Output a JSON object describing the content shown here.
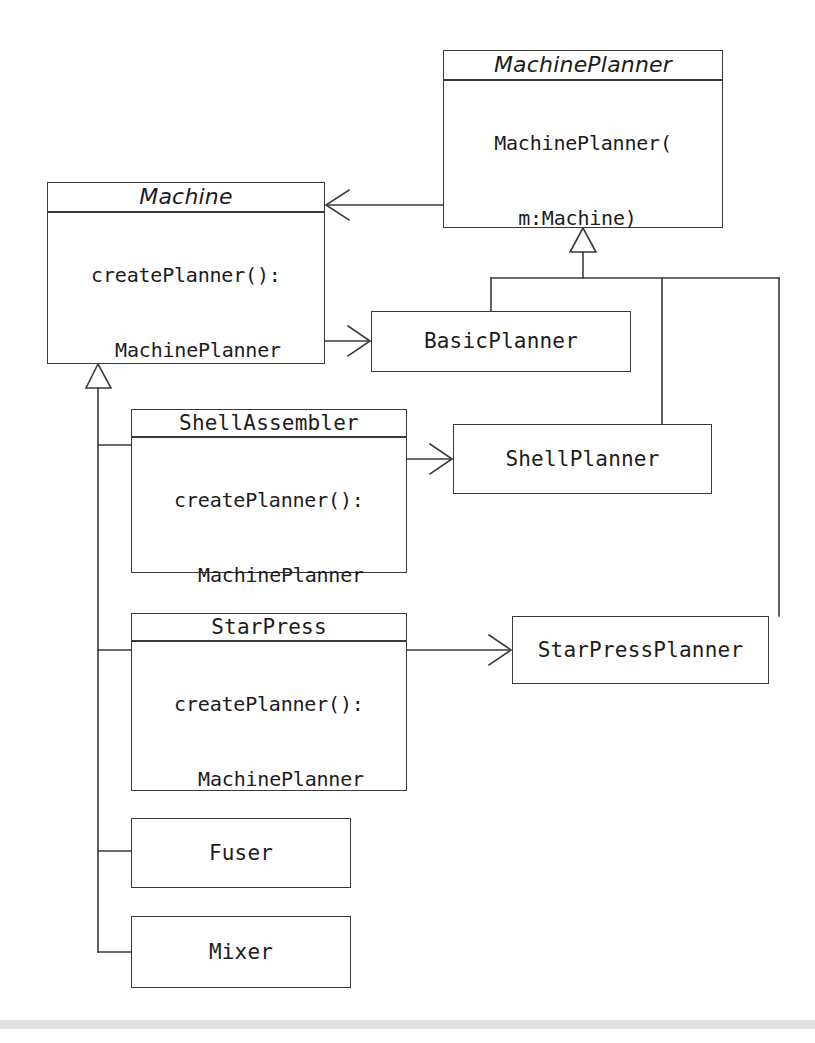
{
  "diagram": {
    "type": "uml-class-diagram",
    "canvas": {
      "width": 815,
      "height": 1043
    },
    "stroke_color": "#3a3a3a",
    "text_color": "#1c1c1c",
    "background": "#ffffff",
    "footer_band_color": "#dcdcdc"
  },
  "classes": [
    {
      "id": "machine-planner",
      "name": "MachinePlanner",
      "abstract": true,
      "attributes": "",
      "operations_lines": [
        "MachinePlanner(",
        "m:Machine)"
      ],
      "box": {
        "x": 443,
        "y": 50,
        "w": 280,
        "h": 178
      },
      "compartments": {
        "name_h": 72,
        "attrs_h": 23
      }
    },
    {
      "id": "machine",
      "name": "Machine",
      "abstract": true,
      "attributes": "",
      "operations_lines": [
        "createPlanner():",
        "MachinePlanner"
      ],
      "box": {
        "x": 47,
        "y": 182,
        "w": 278,
        "h": 182
      },
      "compartments": {
        "name_h": 71,
        "attrs_h": 22
      }
    },
    {
      "id": "basic-planner",
      "name": "BasicPlanner",
      "abstract": false,
      "attributes": null,
      "operations_lines": null,
      "box": {
        "x": 371,
        "y": 311,
        "w": 260,
        "h": 61
      },
      "compartments": {
        "name_h": 61,
        "attrs_h": 0
      }
    },
    {
      "id": "shell-assembler",
      "name": "ShellAssembler",
      "abstract": false,
      "attributes": "",
      "operations_lines": [
        "createPlanner():",
        "MachinePlanner"
      ],
      "box": {
        "x": 131,
        "y": 409,
        "w": 276,
        "h": 164
      },
      "compartments": {
        "name_h": 71,
        "attrs_h": 22
      }
    },
    {
      "id": "shell-planner",
      "name": "ShellPlanner",
      "abstract": false,
      "attributes": null,
      "operations_lines": null,
      "box": {
        "x": 453,
        "y": 424,
        "w": 259,
        "h": 70
      },
      "compartments": {
        "name_h": 70,
        "attrs_h": 0
      }
    },
    {
      "id": "star-press",
      "name": "StarPress",
      "abstract": false,
      "attributes": "",
      "operations_lines": [
        "createPlanner():",
        "MachinePlanner"
      ],
      "box": {
        "x": 131,
        "y": 613,
        "w": 276,
        "h": 178
      },
      "compartments": {
        "name_h": 73,
        "attrs_h": 22
      }
    },
    {
      "id": "star-press-planner",
      "name": "StarPressPlanner",
      "abstract": false,
      "attributes": null,
      "operations_lines": null,
      "box": {
        "x": 512,
        "y": 616,
        "w": 257,
        "h": 68
      },
      "compartments": {
        "name_h": 68,
        "attrs_h": 0
      }
    },
    {
      "id": "fuser",
      "name": "Fuser",
      "abstract": false,
      "attributes": null,
      "operations_lines": null,
      "box": {
        "x": 131,
        "y": 818,
        "w": 220,
        "h": 70
      },
      "compartments": {
        "name_h": 70,
        "attrs_h": 0
      }
    },
    {
      "id": "mixer",
      "name": "Mixer",
      "abstract": false,
      "attributes": null,
      "operations_lines": null,
      "box": {
        "x": 131,
        "y": 916,
        "w": 220,
        "h": 72
      },
      "compartments": {
        "name_h": 72,
        "attrs_h": 0
      }
    }
  ],
  "relationships": [
    {
      "id": "rel-planner-to-machine",
      "kind": "association",
      "from": "machine-planner",
      "to": "machine",
      "arrow": "open-arrow"
    },
    {
      "id": "rel-machine-to-basicplanner",
      "kind": "dependency-create",
      "from": "machine",
      "to": "basic-planner",
      "arrow": "open-arrow"
    },
    {
      "id": "rel-shellassembler-to-shellplanner",
      "kind": "dependency-create",
      "from": "shell-assembler",
      "to": "shell-planner",
      "arrow": "open-arrow"
    },
    {
      "id": "rel-starpress-to-starpressplanner",
      "kind": "dependency-create",
      "from": "star-press",
      "to": "star-press-planner",
      "arrow": "open-arrow"
    },
    {
      "id": "rel-basicplanner-generalization",
      "kind": "generalization",
      "from": "basic-planner",
      "to": "machine-planner",
      "arrow": "hollow-triangle"
    },
    {
      "id": "rel-shellplanner-generalization",
      "kind": "generalization",
      "from": "shell-planner",
      "to": "machine-planner",
      "arrow": "hollow-triangle"
    },
    {
      "id": "rel-starpressplanner-generalization",
      "kind": "generalization",
      "from": "star-press-planner",
      "to": "machine-planner",
      "arrow": "hollow-triangle"
    },
    {
      "id": "rel-shellassembler-generalization",
      "kind": "generalization",
      "from": "shell-assembler",
      "to": "machine",
      "arrow": "hollow-triangle"
    },
    {
      "id": "rel-starpress-generalization",
      "kind": "generalization",
      "from": "star-press",
      "to": "machine",
      "arrow": "hollow-triangle"
    },
    {
      "id": "rel-fuser-generalization",
      "kind": "generalization",
      "from": "fuser",
      "to": "machine",
      "arrow": "hollow-triangle"
    },
    {
      "id": "rel-mixer-generalization",
      "kind": "generalization",
      "from": "mixer",
      "to": "machine",
      "arrow": "hollow-triangle"
    }
  ]
}
